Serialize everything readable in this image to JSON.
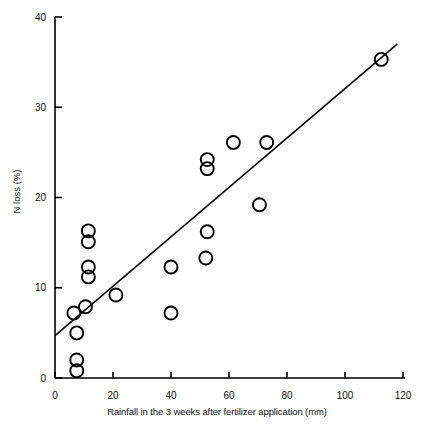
{
  "chart_data": {
    "type": "scatter",
    "title": "",
    "xlabel": "Rainfall in the 3 weeks after fertilizer application (mm)",
    "ylabel": "N loss (%)",
    "xlim": [
      0,
      120
    ],
    "ylim": [
      0,
      40
    ],
    "xticks": [
      0,
      20,
      40,
      60,
      80,
      100,
      120
    ],
    "yticks": [
      0,
      10,
      20,
      30,
      40
    ],
    "xticklabels": [
      "0",
      "20",
      "40",
      "60",
      "80",
      "100",
      "120"
    ],
    "yticklabels": [
      "0",
      "10",
      "20",
      "30",
      "40"
    ],
    "grid": false,
    "legend": null,
    "marker": "open-circle",
    "points": [
      {
        "x": 7.5,
        "y": 2.0
      },
      {
        "x": 7.5,
        "y": 0.8
      },
      {
        "x": 7.5,
        "y": 5.0
      },
      {
        "x": 6.5,
        "y": 7.2
      },
      {
        "x": 10.5,
        "y": 7.9
      },
      {
        "x": 11.5,
        "y": 11.2
      },
      {
        "x": 11.5,
        "y": 12.3
      },
      {
        "x": 11.5,
        "y": 15.1
      },
      {
        "x": 11.5,
        "y": 16.3
      },
      {
        "x": 21.0,
        "y": 9.2
      },
      {
        "x": 40.0,
        "y": 7.2
      },
      {
        "x": 40.0,
        "y": 12.3
      },
      {
        "x": 52.0,
        "y": 13.3
      },
      {
        "x": 52.5,
        "y": 16.2
      },
      {
        "x": 52.5,
        "y": 23.2
      },
      {
        "x": 52.5,
        "y": 24.2
      },
      {
        "x": 61.5,
        "y": 26.1
      },
      {
        "x": 70.5,
        "y": 19.2
      },
      {
        "x": 73.0,
        "y": 26.1
      },
      {
        "x": 112.5,
        "y": 35.3
      }
    ],
    "fit_line": {
      "x0": 0,
      "y0": 4.7,
      "x1": 118,
      "y1": 37.0
    }
  },
  "axis": {
    "x_label": "Rainfall in the 3 weeks after fertilizer application (mm)",
    "y_label": "N loss (%)"
  },
  "style": {
    "marker_radius_px": 6.5,
    "marker_stroke": "#000000",
    "axis_color": "#000000",
    "line_color": "#000000",
    "background": "#ffffff"
  }
}
